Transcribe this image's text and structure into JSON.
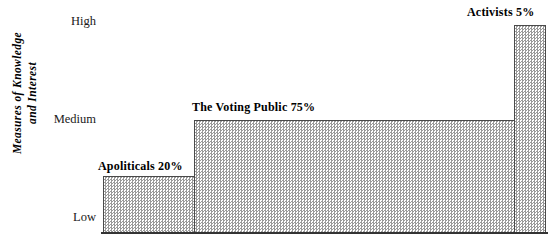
{
  "chart_data": {
    "type": "bar",
    "title": "",
    "subtitle": "",
    "xlabel": "",
    "ylabel": "Measures of Knowledge\nand Interest",
    "categories": [
      "Apoliticals",
      "The Voting Public",
      "Activists"
    ],
    "values": [
      20,
      75,
      5
    ],
    "value_unit": "%",
    "data_labels": [
      "Apoliticals  20%",
      "The Voting Public   75%",
      "Activists  5%"
    ],
    "y_tick_labels": [
      "High",
      "Medium",
      "Low"
    ],
    "y_levels": {
      "Apoliticals": "Low",
      "The Voting Public": "Medium",
      "Activists": "High"
    },
    "ylim": [
      "Low",
      "High"
    ],
    "grid": false,
    "legend": false
  },
  "axis": {
    "y_title_line1": "Measures of Knowledge",
    "y_title_line2": "and Interest",
    "y_title": "Measures of Knowledge\nand Interest",
    "ticks": {
      "high": "High",
      "medium": "Medium",
      "low": "Low"
    }
  },
  "bars": {
    "apoliticals": {
      "label": "Apoliticals  20%",
      "name": "Apoliticals",
      "percent": "20%"
    },
    "voting_public": {
      "label": "The Voting Public   75%",
      "name": "The Voting Public",
      "percent": "75%"
    },
    "activists": {
      "label": "Activists  5%",
      "name": "Activists",
      "percent": "5%"
    }
  },
  "colors": {
    "bar_fill": "#e2e2e2",
    "bar_pattern": "#9a9a9a",
    "bar_border": "#4a4a4a",
    "axis_line": "#333333",
    "text": "#000000"
  }
}
